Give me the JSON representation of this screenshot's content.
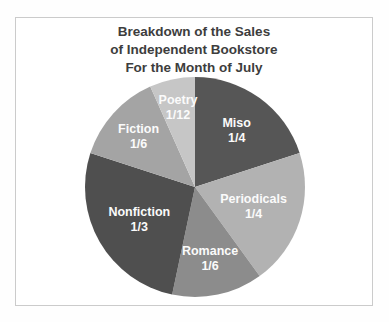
{
  "chart_data": {
    "type": "pie",
    "title_lines": [
      "Breakdown of the Sales",
      "of Independent Bookstore",
      "For the Month of July"
    ],
    "title_color": "#3d3d3d",
    "panel_border_color": "#cbcbcb",
    "label_text_color": "#fbfbfb",
    "start_angle_deg": 0,
    "direction": "clockwise",
    "total_parts": 15,
    "slices": [
      {
        "label": "Miso",
        "fraction": "1/4",
        "drawn_parts": 3,
        "drawn_angle_deg": 72,
        "color": "#565656",
        "label_r": 0.645
      },
      {
        "label": "Periodicals",
        "fraction": "1/4",
        "drawn_parts": 3,
        "drawn_angle_deg": 72,
        "color": "#b2b2b2",
        "label_r": 0.56
      },
      {
        "label": "Romance",
        "fraction": "1/6",
        "drawn_parts": 2,
        "drawn_angle_deg": 48,
        "color": "#8c8c8c",
        "label_r": 0.66
      },
      {
        "label": "Nonfiction",
        "fraction": "1/3",
        "drawn_parts": 4,
        "drawn_angle_deg": 96,
        "color": "#4f4f4f",
        "label_r": 0.585
      },
      {
        "label": "Fiction",
        "fraction": "1/6",
        "drawn_parts": 2,
        "drawn_angle_deg": 48,
        "color": "#a4a4a4",
        "label_r": 0.69
      },
      {
        "label": "Poetry",
        "fraction": "1/12",
        "drawn_parts": 1,
        "drawn_angle_deg": 24,
        "color": "#c6c6c6",
        "label_r": 0.745
      }
    ]
  }
}
